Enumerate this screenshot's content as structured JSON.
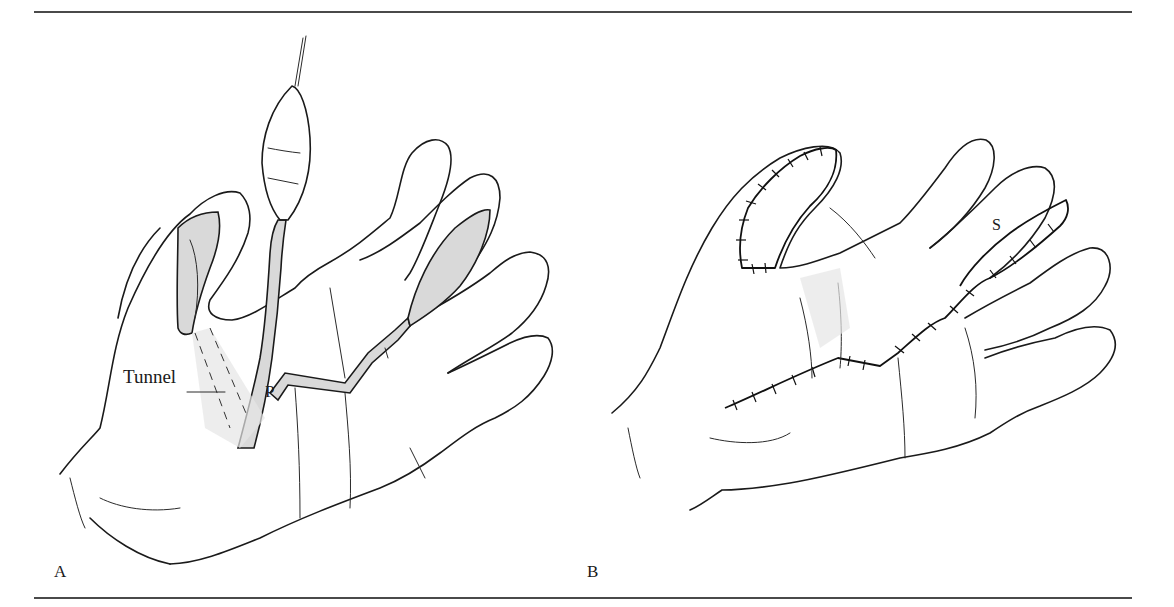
{
  "figure": {
    "type": "surgical-illustration",
    "panels": [
      {
        "id": "A",
        "label": "A",
        "subject": "palm of hand with pedicle flap raised and tunnelled",
        "callouts": [
          {
            "text": "Tunnel",
            "target": "subcutaneous tunnel to thumb"
          },
          {
            "text": "P",
            "target": "pedicle"
          }
        ]
      },
      {
        "id": "B",
        "label": "B",
        "subject": "palm of hand after flap inset and closure with sutures",
        "callouts": [
          {
            "text": "S",
            "target": "donor site on finger"
          }
        ]
      }
    ],
    "colors": {
      "line": "#1a1a1a",
      "rule": "#4a4a4a",
      "background": "#ffffff",
      "stipple": "#d9d9d9"
    }
  }
}
